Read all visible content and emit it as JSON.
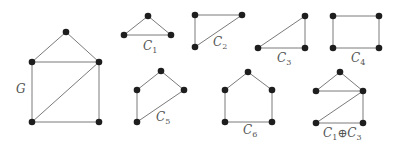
{
  "colors": {
    "node": "#1e1e1e",
    "edge": "#7a7a7a",
    "label": "#555555",
    "background": "#ffffff"
  },
  "graphs": [
    {
      "id": "G",
      "label": "G",
      "sub": "",
      "label_pos": [
        16,
        93
      ],
      "nodes": [
        [
          66,
          32
        ],
        [
          32,
          62
        ],
        [
          99,
          62
        ],
        [
          32,
          122
        ],
        [
          99,
          122
        ]
      ],
      "edges": [
        [
          0,
          1
        ],
        [
          0,
          2
        ],
        [
          1,
          2
        ],
        [
          1,
          3
        ],
        [
          2,
          3
        ],
        [
          2,
          4
        ],
        [
          3,
          4
        ]
      ]
    },
    {
      "id": "C1",
      "label": "C",
      "sub": "1",
      "label_pos": [
        143,
        50
      ],
      "nodes": [
        [
          148,
          16
        ],
        [
          124,
          35
        ],
        [
          171,
          35
        ]
      ],
      "edges": [
        [
          0,
          1
        ],
        [
          0,
          2
        ],
        [
          1,
          2
        ]
      ]
    },
    {
      "id": "C2",
      "label": "C",
      "sub": "2",
      "label_pos": [
        213,
        46
      ],
      "nodes": [
        [
          195,
          15
        ],
        [
          242,
          15
        ],
        [
          195,
          47
        ]
      ],
      "edges": [
        [
          0,
          1
        ],
        [
          0,
          2
        ],
        [
          1,
          2
        ]
      ]
    },
    {
      "id": "C3",
      "label": "C",
      "sub": "3",
      "label_pos": [
        277,
        62
      ],
      "nodes": [
        [
          305,
          16
        ],
        [
          258,
          48
        ],
        [
          305,
          48
        ]
      ],
      "edges": [
        [
          0,
          1
        ],
        [
          0,
          2
        ],
        [
          1,
          2
        ]
      ]
    },
    {
      "id": "C4",
      "label": "C",
      "sub": "4",
      "label_pos": [
        351,
        62
      ],
      "nodes": [
        [
          333,
          16
        ],
        [
          379,
          16
        ],
        [
          333,
          48
        ],
        [
          379,
          48
        ]
      ],
      "edges": [
        [
          0,
          1
        ],
        [
          0,
          2
        ],
        [
          1,
          3
        ],
        [
          2,
          3
        ]
      ]
    },
    {
      "id": "C5",
      "label": "C",
      "sub": "5",
      "label_pos": [
        156,
        121
      ],
      "nodes": [
        [
          161,
          71
        ],
        [
          137,
          90
        ],
        [
          184,
          90
        ],
        [
          137,
          122
        ]
      ],
      "edges": [
        [
          0,
          1
        ],
        [
          0,
          2
        ],
        [
          1,
          3
        ],
        [
          2,
          3
        ]
      ]
    },
    {
      "id": "C6",
      "label": "C",
      "sub": "6",
      "label_pos": [
        243,
        134
      ],
      "nodes": [
        [
          248,
          72
        ],
        [
          225,
          90
        ],
        [
          272,
          90
        ],
        [
          225,
          122
        ],
        [
          272,
          122
        ]
      ],
      "edges": [
        [
          0,
          1
        ],
        [
          0,
          2
        ],
        [
          1,
          3
        ],
        [
          2,
          4
        ],
        [
          3,
          4
        ]
      ]
    },
    {
      "id": "C1xorC3",
      "label": "C",
      "sub": "1",
      "label_pos": [
        323,
        137
      ],
      "op": "⊕",
      "label2": "C",
      "sub2": "3",
      "nodes": [
        [
          340,
          72
        ],
        [
          316,
          91
        ],
        [
          363,
          91
        ],
        [
          316,
          123
        ],
        [
          363,
          123
        ]
      ],
      "edges": [
        [
          0,
          1
        ],
        [
          0,
          2
        ],
        [
          1,
          2
        ],
        [
          2,
          3
        ],
        [
          2,
          4
        ],
        [
          3,
          4
        ]
      ]
    }
  ]
}
